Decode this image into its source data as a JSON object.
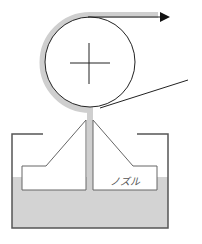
{
  "diagram": {
    "type": "coating-apparatus-schematic",
    "labels": {
      "nozzle": "ノズル"
    },
    "elements": [
      {
        "name": "roller",
        "shape": "circle",
        "marker": "plus-cross"
      },
      {
        "name": "coated-film",
        "shape": "gray band wrapping roller"
      },
      {
        "name": "web-output-arrow",
        "shape": "arrow",
        "direction": "right"
      },
      {
        "name": "web-input-line",
        "shape": "tangent line"
      },
      {
        "name": "tank",
        "shape": "open-top container"
      },
      {
        "name": "coating-liquid",
        "shape": "gray fill"
      },
      {
        "name": "nozzle",
        "shape": "slot die with center channel"
      }
    ],
    "colors": {
      "line": "#333333",
      "coating": "#cfcfcf",
      "liquid": "#d3d3d3",
      "background": "#ffffff"
    }
  }
}
